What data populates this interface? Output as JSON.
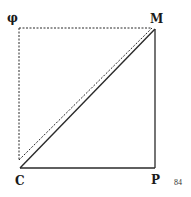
{
  "diagram": {
    "labels": {
      "phi": "φ",
      "M": "M",
      "C": "C",
      "P": "P"
    },
    "page_number": "84",
    "colors": {
      "line": "#2a2a2a",
      "background": "#ffffff"
    }
  }
}
